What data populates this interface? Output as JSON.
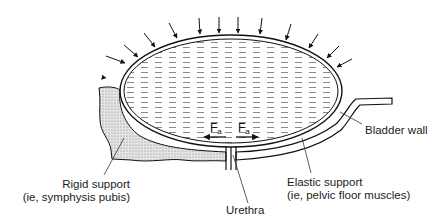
{
  "figure": {
    "top_text_fragment": "(ie, ...)",
    "labels": {
      "bladder_wall": "Bladder wall",
      "rigid_support_line1": "Rigid support",
      "rigid_support_line2": "(ie, symphysis pubis)",
      "urethra": "Urethra",
      "elastic_support_line1": "Elastic support",
      "elastic_support_line2": "(ie, pelvic floor muscles)"
    },
    "forces": {
      "left": {
        "symbol": "F",
        "subscript": "a"
      },
      "right": {
        "symbol": "F",
        "subscript": "a"
      }
    },
    "external_pressure_arrows": 14,
    "colors": {
      "line": "#111111",
      "fluid_dash": "#8a8a8a",
      "rigid_fill": "#d6d6d6",
      "background": "#ffffff"
    }
  }
}
